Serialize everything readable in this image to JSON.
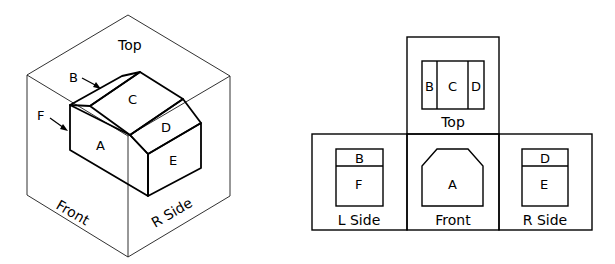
{
  "isometric": {
    "cube_face_labels": {
      "top": "Top",
      "front": "Front",
      "right_side": "R Side"
    },
    "surface_labels": [
      "A",
      "B",
      "C",
      "D",
      "E"
    ],
    "arrow_labels": {
      "b": "B",
      "f": "F"
    }
  },
  "orthographic": {
    "views": [
      {
        "name": "Top",
        "label": "Top",
        "surfaces": [
          "B",
          "C",
          "D"
        ]
      },
      {
        "name": "L Side",
        "label": "L Side",
        "surfaces": [
          "B",
          "F"
        ]
      },
      {
        "name": "Front",
        "label": "Front",
        "surfaces": [
          "A"
        ]
      },
      {
        "name": "R Side",
        "label": "R Side",
        "surfaces": [
          "D",
          "E"
        ]
      }
    ]
  }
}
